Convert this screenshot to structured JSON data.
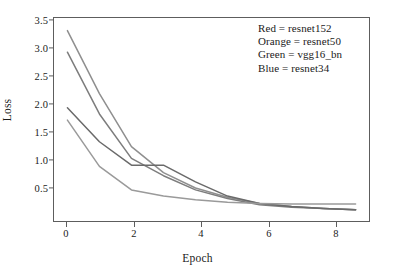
{
  "chart_data": {
    "type": "line",
    "title": "",
    "xlabel": "Epoch",
    "ylabel": "Loss",
    "xlim": [
      -0.45,
      9.45
    ],
    "ylim": [
      0.3,
      3.62
    ],
    "x": [
      0,
      1,
      2,
      3,
      4,
      5,
      6,
      7,
      8,
      9
    ],
    "xticks": [
      0,
      2,
      4,
      6,
      8
    ],
    "xtick_labels": [
      "0",
      "2",
      "4",
      "6",
      "8"
    ],
    "yticks": [
      0.5,
      1.0,
      1.5,
      2.0,
      2.5,
      3.0,
      3.5
    ],
    "ytick_labels": [
      "0.5",
      "1.0",
      "1.5",
      "2.0",
      "2.5",
      "3.0",
      "3.5"
    ],
    "grid": false,
    "legend_position": "upper right",
    "series": [
      {
        "name": "resnet152",
        "legend_color_word": "Red",
        "color": "#7d7d7d",
        "values": [
          3.05,
          2.05,
          1.33,
          1.05,
          0.82,
          0.68,
          0.58,
          0.54,
          0.52,
          0.5
        ]
      },
      {
        "name": "resnet50",
        "legend_color_word": "Orange",
        "color": "#8f8f8f",
        "values": [
          3.4,
          2.38,
          1.52,
          1.1,
          0.85,
          0.7,
          0.6,
          0.55,
          0.52,
          0.5
        ]
      },
      {
        "name": "vgg16_bn",
        "legend_color_word": "Green",
        "color": "#9a9a9a",
        "values": [
          1.95,
          1.2,
          0.82,
          0.72,
          0.66,
          0.62,
          0.6,
          0.59,
          0.59,
          0.59
        ]
      },
      {
        "name": "resnet34",
        "legend_color_word": "Blue",
        "color": "#6a6a6a",
        "values": [
          2.15,
          1.6,
          1.22,
          1.22,
          0.95,
          0.72,
          0.6,
          0.55,
          0.52,
          0.5
        ]
      }
    ]
  },
  "axes": {
    "ylabel": "Loss",
    "xlabel": "Epoch",
    "ytick_labels": [
      "3.5",
      "3.0",
      "2.5",
      "2.0",
      "1.5",
      "1.0",
      "0.5"
    ],
    "xtick_labels": [
      "0",
      "2",
      "4",
      "6",
      "8"
    ]
  },
  "legend": {
    "entries": [
      "Red = resnet152",
      "Orange = resnet50",
      "Green = vgg16_bn",
      "Blue = resnet34"
    ]
  }
}
